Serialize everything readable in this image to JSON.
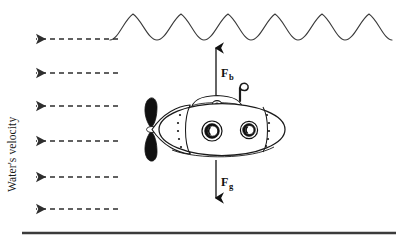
{
  "figure": {
    "kind": "physics-free-body-diagram",
    "background_color": "#ffffff",
    "ink_color": "#1a1a1a"
  },
  "labels": {
    "water_velocity": "Water's velocity",
    "buoyant_force": "F",
    "buoyant_force_subscript": "b",
    "gravity_force": "F",
    "gravity_force_subscript": "g"
  },
  "water_surface": {
    "name": "wave-surface",
    "wave_count": 6,
    "start_x": 110,
    "end_x": 392,
    "baseline_y": 40,
    "crest_y": 14,
    "stroke_color": "#3a3a3a",
    "stroke_width": 1.1
  },
  "seafloor": {
    "name": "seafloor-line",
    "x1": 22,
    "x2": 396,
    "y": 233,
    "stroke_color": "#3b3b3b",
    "stroke_width": 2.6
  },
  "current_arrows": {
    "name": "water-velocity-arrows",
    "direction": "left",
    "stroke_color": "#2e2e2e",
    "dash": "5,4",
    "items": [
      {
        "y": 39,
        "x_tail": 118,
        "x_head": 33
      },
      {
        "y": 73,
        "x_tail": 118,
        "x_head": 33
      },
      {
        "y": 106,
        "x_tail": 118,
        "x_head": 33
      },
      {
        "y": 141,
        "x_tail": 118,
        "x_head": 33
      },
      {
        "y": 177,
        "x_tail": 118,
        "x_head": 33
      },
      {
        "y": 209,
        "x_tail": 118,
        "x_head": 33
      }
    ]
  },
  "force_vectors": [
    {
      "name": "buoyant-force-arrow",
      "direction": "up",
      "x": 216,
      "y_tail": 97,
      "y_head": 46,
      "label_x": 222,
      "label_y": 73
    },
    {
      "name": "gravity-force-arrow",
      "direction": "down",
      "x": 216,
      "y_tail": 160,
      "y_head": 200,
      "label_x": 222,
      "label_y": 182
    }
  ],
  "submarine": {
    "name": "submarine",
    "hull": {
      "center_x": 222,
      "center_y": 129,
      "radius_x": 63,
      "radius_y": 26,
      "fill": "#ffffff",
      "stroke": "#1a1a1a"
    },
    "conning_tower": {
      "center_x": 217,
      "top_y": 99
    },
    "periscope": {
      "x": 243,
      "top_y": 86
    },
    "hatch": {
      "cx": 217,
      "cy": 104
    },
    "propeller": {
      "cx": 151,
      "cy": 129,
      "blade_color": "#111111"
    },
    "portholes": [
      {
        "cx": 212,
        "cy": 131,
        "r_outer": 10,
        "r_inner": 5.6
      },
      {
        "cx": 249,
        "cy": 130,
        "r_outer": 8.6,
        "r_inner": 4.8
      }
    ],
    "seam_dots_front": 5,
    "seam_dots_rear": 5
  }
}
